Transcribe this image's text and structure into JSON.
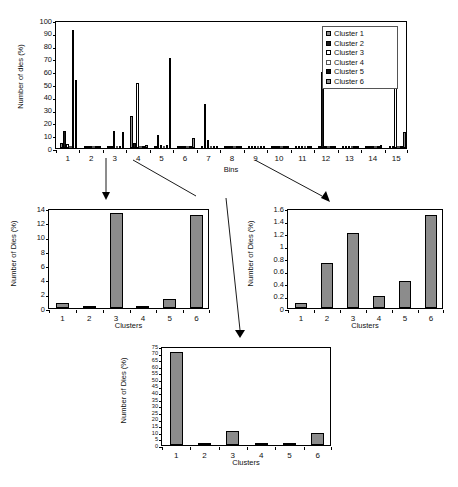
{
  "chart_data": [
    {
      "id": "main",
      "type": "bar",
      "title": "",
      "xlabel": "Bins",
      "ylabel": "Number of dies (%)",
      "ylim": [
        0,
        100
      ],
      "ytick_step": 10,
      "yticks": [
        "0",
        "10",
        "20",
        "30",
        "40",
        "50",
        "60",
        "70",
        "80",
        "90",
        "100"
      ],
      "grid": false,
      "legend_position": "top-right",
      "categories": [
        "1",
        "2",
        "3",
        "4",
        "5",
        "6",
        "7",
        "8",
        "9",
        "10",
        "11",
        "12",
        "13",
        "14",
        "15"
      ],
      "series": [
        {
          "name": "Cluster 1",
          "color": "#8c8c8c",
          "edge": "#000000",
          "values": [
            4.0,
            0.2,
            0.5,
            25.0,
            0.4,
            0.5,
            0.3,
            0.1,
            0.4,
            0.1,
            0.1,
            0.2,
            0.2,
            0.3,
            0.4
          ]
        },
        {
          "name": "Cluster 2",
          "color": "#1a1a1a",
          "edge": "#000000",
          "values": [
            13.0,
            0.2,
            0.7,
            4.0,
            10.2,
            1.0,
            34.3,
            0.2,
            0.5,
            0.2,
            0.2,
            59.0,
            0.3,
            0.5,
            0.6
          ]
        },
        {
          "name": "Cluster 3",
          "color": "#ffffff",
          "edge": "#000000",
          "values": [
            3.0,
            0.1,
            13.0,
            50.5,
            2.5,
            1.2,
            6.3,
            0.2,
            0.3,
            0.2,
            0.2,
            0.4,
            0.2,
            1.8,
            93.3
          ]
        },
        {
          "name": "Cluster 4",
          "color": "#ffffff",
          "edge": "#555555",
          "values": [
            0.6,
            0.1,
            0.4,
            0.5,
            1.8,
            0.5,
            0.4,
            0.2,
            0.8,
            0.2,
            0.2,
            0.3,
            0.3,
            0.5,
            0.5
          ]
        },
        {
          "name": "Cluster 5",
          "color": "#111111",
          "edge": "#000000",
          "values": [
            92.0,
            0.2,
            0.6,
            1.1,
            2.0,
            0.6,
            0.5,
            0.2,
            0.6,
            0.2,
            0.2,
            0.4,
            0.3,
            0.6,
            0.5
          ]
        },
        {
          "name": "Cluster 6",
          "color": "#8c8c8c",
          "edge": "#000000",
          "values": [
            53.0,
            0.2,
            12.7,
            2.2,
            70.0,
            7.8,
            1.0,
            0.2,
            1.2,
            0.3,
            0.2,
            0.5,
            0.4,
            2.4,
            12.8
          ]
        }
      ]
    },
    {
      "id": "sub_left",
      "type": "bar",
      "title": "",
      "xlabel": "Clusters",
      "ylabel": "Number of Dies (%)",
      "ylim": [
        0,
        14
      ],
      "ytick_step": 2,
      "yticks": [
        "0",
        "2",
        "4",
        "6",
        "8",
        "10",
        "12",
        "14"
      ],
      "grid": false,
      "bar_color": "#8c8c8c",
      "bar_edge": "#000000",
      "categories": [
        "1",
        "2",
        "3",
        "4",
        "5",
        "6"
      ],
      "values": [
        0.7,
        0.2,
        13.3,
        0.1,
        1.3,
        13.0
      ]
    },
    {
      "id": "sub_right",
      "type": "bar",
      "title": "",
      "xlabel": "Clusters",
      "ylabel": "Number of Dies (%)",
      "ylim": [
        0,
        1.6
      ],
      "ytick_step": 0.2,
      "yticks": [
        "0",
        "0.2",
        "0.4",
        "0.6",
        "0.8",
        "1",
        "1.2",
        "1.4",
        "1.6"
      ],
      "grid": false,
      "bar_color": "#8c8c8c",
      "bar_edge": "#000000",
      "categories": [
        "1",
        "2",
        "3",
        "4",
        "5",
        "6"
      ],
      "values": [
        0.08,
        0.72,
        1.2,
        0.19,
        0.44,
        1.49
      ]
    },
    {
      "id": "sub_bottom",
      "type": "bar",
      "title": "",
      "xlabel": "Clusters",
      "ylabel": "Number of Dies (%)",
      "ylim": [
        0,
        75
      ],
      "ytick_step": 5,
      "yticks": [
        "0",
        "5",
        "10",
        "15",
        "20",
        "25",
        "30",
        "35",
        "40",
        "45",
        "50",
        "55",
        "60",
        "65",
        "70",
        "75"
      ],
      "grid": false,
      "bar_color": "#8c8c8c",
      "bar_edge": "#000000",
      "categories": [
        "1",
        "2",
        "3",
        "4",
        "5",
        "6"
      ],
      "values": [
        70.5,
        0.4,
        10.3,
        0.05,
        1.0,
        8.8
      ]
    }
  ],
  "figure": {
    "caption": ""
  }
}
